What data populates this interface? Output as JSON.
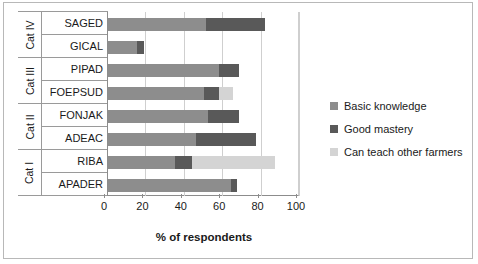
{
  "chart_data": {
    "type": "bar",
    "orientation": "horizontal",
    "stacked": true,
    "title": "",
    "xlabel": "% of respondents",
    "ylabel": "",
    "xlim": [
      0,
      100
    ],
    "xticks": [
      0,
      20,
      40,
      60,
      80,
      100
    ],
    "grid": true,
    "legend_position": "right",
    "categories": [
      "SAGED",
      "GICAL",
      "PIPAD",
      "FOEPSUD",
      "FONJAK",
      "ADEAC",
      "RIBA",
      "APADER"
    ],
    "groups": [
      {
        "name": "Cat IV",
        "members": [
          "SAGED",
          "GICAL"
        ]
      },
      {
        "name": "Cat III",
        "members": [
          "PIPAD",
          "FOEPSUD"
        ]
      },
      {
        "name": "Cat II",
        "members": [
          "FONJAK",
          "ADEAC"
        ]
      },
      {
        "name": "Cat I",
        "members": [
          "RIBA",
          "APADER"
        ]
      }
    ],
    "series": [
      {
        "name": "Basic knowledge",
        "color": "#8d8d8d",
        "values": [
          51,
          15,
          58,
          50,
          52,
          46,
          35,
          64
        ]
      },
      {
        "name": "Good mastery",
        "color": "#595959",
        "values": [
          31,
          4,
          10,
          8,
          16,
          31,
          9,
          3
        ]
      },
      {
        "name": "Can teach other farmers",
        "color": "#d4d4d4",
        "values": [
          0,
          0,
          0,
          7,
          0,
          0,
          43,
          0
        ]
      }
    ],
    "totals": [
      82,
      19,
      68,
      65,
      68,
      77,
      87,
      67
    ]
  },
  "axis": {
    "tick_labels": [
      "0",
      "20",
      "40",
      "60",
      "80",
      "100"
    ],
    "title": "% of respondents"
  },
  "groups": [
    {
      "label": "Cat IV",
      "rows": [
        "SAGED",
        "GICAL"
      ]
    },
    {
      "label": "Cat III",
      "rows": [
        "PIPAD",
        "FOEPSUD"
      ]
    },
    {
      "label": "Cat II",
      "rows": [
        "FONJAK",
        "ADEAC"
      ]
    },
    {
      "label": "Cat I",
      "rows": [
        "RIBA",
        "APADER"
      ]
    }
  ],
  "legend": {
    "items": [
      {
        "label": "Basic knowledge",
        "color": "#8d8d8d"
      },
      {
        "label": "Good mastery",
        "color": "#595959"
      },
      {
        "label": "Can teach other farmers",
        "color": "#d4d4d4"
      }
    ]
  },
  "colors": {
    "basic": "#8d8d8d",
    "mastery": "#595959",
    "teach": "#d4d4d4",
    "frame": "#b8b8b8",
    "grid": "#cfcfcf",
    "axis": "#8c8c8c"
  }
}
